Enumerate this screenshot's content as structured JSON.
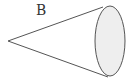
{
  "figure": {
    "label": "B",
    "shape": "cone",
    "orientation": "apex-left",
    "colors": {
      "stroke": "#555555",
      "base_fill": "#eeeeee",
      "background": "#ffffff"
    }
  }
}
